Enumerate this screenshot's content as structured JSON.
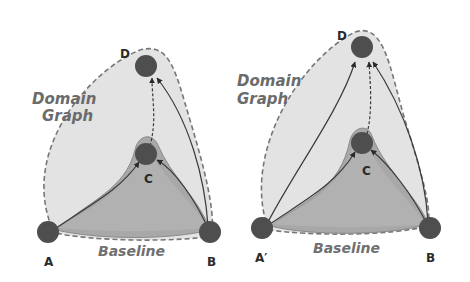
{
  "panels": [
    {
      "domain_label_line1": "Domain",
      "domain_label_line2": "Graph",
      "baseline_label": "Baseline",
      "nodes": {
        "A": "A",
        "B": "B",
        "C": "C",
        "D": "D"
      }
    },
    {
      "domain_label_line1": "Domain",
      "domain_label_line2": "Graph",
      "baseline_label": "Baseline",
      "nodes": {
        "A": "A′",
        "B": "B",
        "C": "C",
        "D": "D"
      }
    }
  ],
  "colors": {
    "domain_fill": "#e2e2e2",
    "baseline_fill": "#a9a9a9",
    "baseline_inner_fill": "#bdbdbd",
    "node_fill": "#4e4e4e",
    "edge": "#3a3a3a",
    "dashed_outline": "#777777"
  }
}
